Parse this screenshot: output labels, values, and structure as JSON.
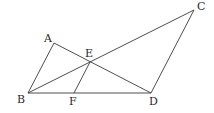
{
  "points": {
    "A": {
      "x": 54,
      "y": 43,
      "label": "A",
      "lx": 44,
      "ly": 42
    },
    "B": {
      "x": 28,
      "y": 93,
      "label": "B",
      "lx": 17,
      "ly": 103
    },
    "C": {
      "x": 194,
      "y": 10,
      "label": "C",
      "lx": 197,
      "ly": 10
    },
    "D": {
      "x": 151,
      "y": 93,
      "label": "D",
      "lx": 149,
      "ly": 105
    },
    "E": {
      "x": 90,
      "y": 62,
      "label": "E",
      "lx": 85,
      "ly": 57
    },
    "F": {
      "x": 74,
      "y": 93,
      "label": "F",
      "lx": 69,
      "ly": 105
    }
  },
  "segments": [
    [
      "A",
      "B"
    ],
    [
      "A",
      "D"
    ],
    [
      "B",
      "C"
    ],
    [
      "B",
      "D"
    ],
    [
      "C",
      "D"
    ],
    [
      "E",
      "F"
    ]
  ]
}
